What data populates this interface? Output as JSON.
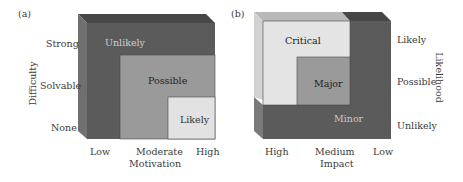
{
  "colors": {
    "dark": "#5b5b5b",
    "dark_top": "#4a4a4a",
    "dark_side": "#6e6e6e",
    "medium": "#9a9a9a",
    "light": "#e4e4e4",
    "light_top": "#b8b8b8",
    "light_side": "#d0d0d0",
    "medium_side": "#8a8a8a"
  },
  "panel_a": {
    "tag": "(a)",
    "y_axis_label": "Difficulty",
    "y_ticks": [
      "Strong",
      "Solvable",
      "None"
    ],
    "x_axis_label": "Motivation",
    "x_ticks": [
      "Low",
      "Moderate",
      "High"
    ],
    "regions": [
      {
        "label": "Unlikely",
        "shade": "dark"
      },
      {
        "label": "Possible",
        "shade": "medium"
      },
      {
        "label": "Likely",
        "shade": "light"
      }
    ]
  },
  "panel_b": {
    "tag": "(b)",
    "y_axis_label": "Likelihood",
    "y_ticks": [
      "Likely",
      "Possible",
      "Unlikely"
    ],
    "x_axis_label": "Impact",
    "x_ticks": [
      "High",
      "Medium",
      "Low"
    ],
    "regions": [
      {
        "label": "Critical",
        "shade": "light"
      },
      {
        "label": "Major",
        "shade": "medium"
      },
      {
        "label": "Minor",
        "shade": "dark"
      }
    ]
  }
}
